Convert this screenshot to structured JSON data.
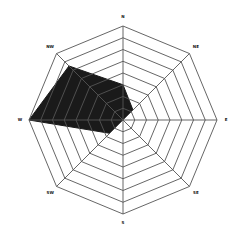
{
  "chart_data": {
    "type": "radar",
    "title": "",
    "categories": [
      "N",
      "NE",
      "E",
      "SE",
      "S",
      "SW",
      "W",
      "NW"
    ],
    "series": [
      {
        "name": "series-1",
        "values": [
          3,
          1.2,
          0,
          0,
          0,
          1.6,
          8,
          6.5
        ],
        "fill": "#1a1a1a"
      }
    ],
    "rings": 8,
    "range": [
      0,
      8
    ],
    "grid": true,
    "legend": "none",
    "grid_color": "#555555"
  }
}
